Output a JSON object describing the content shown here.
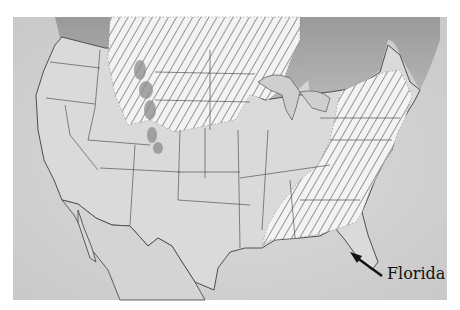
{
  "map": {
    "type": "illustrated map",
    "region": "Contiguous United States",
    "legend_style": "diagonal hatching marks range area",
    "colors": {
      "land": "#d9d9d9",
      "water": "#c8c8c8",
      "canada": "#a9a9a9",
      "border": "#555555",
      "hatch": "#6d6d6d",
      "hatch_bg": "#f2f2f2",
      "mountains": "#8f8f8f"
    },
    "hatched_regions": [
      "Northern Plains and Upper Midwest",
      "Northern Rockies",
      "Eastern and Southeastern states"
    ],
    "annotations": [
      {
        "label": "Florida",
        "arrow": "points to Florida peninsula"
      }
    ]
  }
}
